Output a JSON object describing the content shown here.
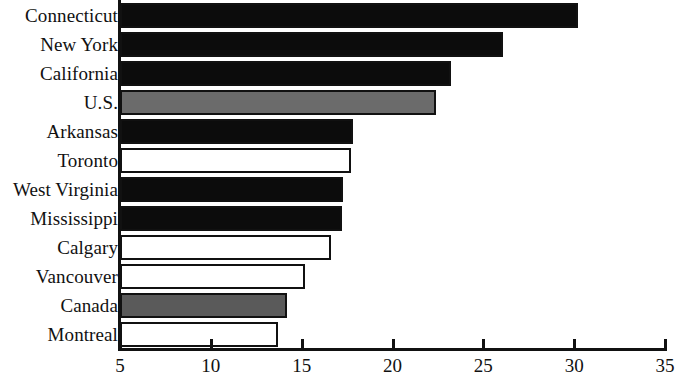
{
  "chart_data": {
    "type": "bar",
    "orientation": "horizontal",
    "title": "",
    "subtitle": "",
    "xlabel": "",
    "ylabel": "",
    "xlim": [
      5,
      35
    ],
    "ylim": null,
    "grid": false,
    "legend": null,
    "xticks": [
      5,
      10,
      15,
      20,
      25,
      30,
      35
    ],
    "xtick_labels": [
      "5",
      "10",
      "15",
      "20",
      "25",
      "30",
      "35"
    ],
    "categories": [
      "Connecticut",
      "New York",
      "California",
      "U.S.",
      "Arkansas",
      "Toronto",
      "West Virginia",
      "Mississippi",
      "Calgary",
      "Vancouver",
      "Canada",
      "Montreal"
    ],
    "values": [
      30.2,
      26.1,
      23.2,
      22.4,
      17.8,
      17.7,
      17.3,
      17.2,
      16.6,
      15.2,
      14.2,
      13.7
    ],
    "bar_styles": [
      "black",
      "black",
      "black",
      "gray",
      "black",
      "white",
      "black",
      "black",
      "white",
      "white",
      "darkgray",
      "white"
    ],
    "colors": {
      "black": "#0c0c0c",
      "gray": "#6b6b6b",
      "darkgray": "#5a5a5a",
      "white": "#ffffff",
      "outline": "#111111",
      "background": "#ffffff"
    }
  }
}
